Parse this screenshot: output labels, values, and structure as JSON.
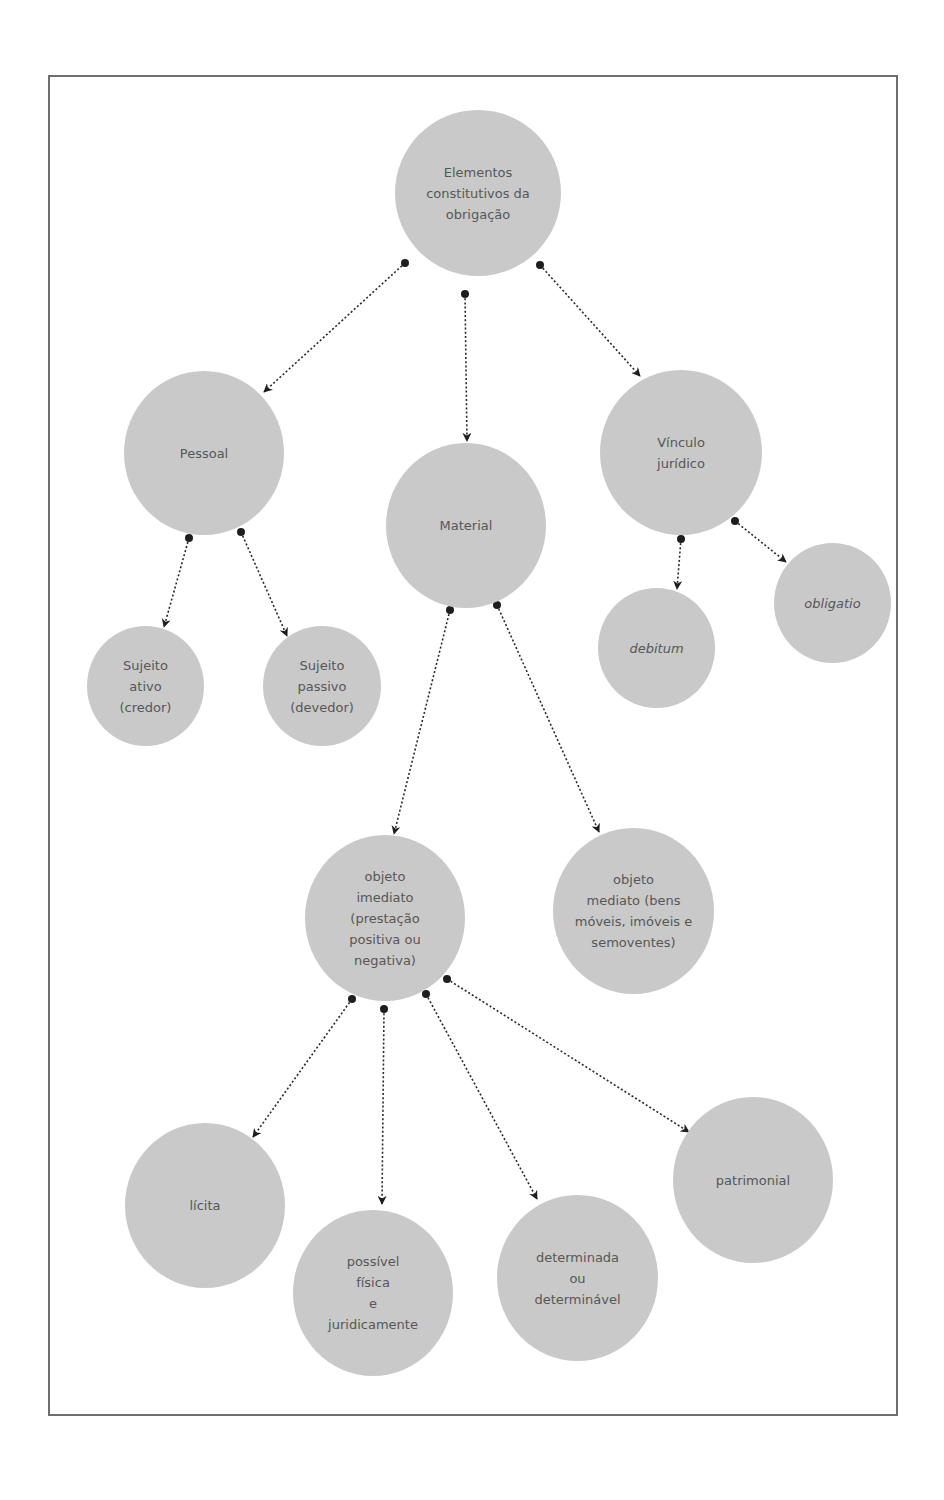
{
  "diagram": {
    "title": "Elementos constitutivos da obrigação",
    "colors": {
      "node_fill": "#c9c9c9",
      "node_text": "#575757",
      "edge": "#2a2a2a",
      "frame": "#6e6e6e"
    },
    "nodes": {
      "root": {
        "label": "Elementos\nconstitutivos da\nobrigação"
      },
      "pessoal": {
        "label": "Pessoal"
      },
      "material": {
        "label": "Material"
      },
      "vinculo": {
        "label": "Vínculo\njurídico"
      },
      "sujeito_ativo": {
        "label": "Sujeito\nativo\n(credor)"
      },
      "sujeito_passivo": {
        "label": "Sujeito\npassivo\n(devedor)"
      },
      "debitum": {
        "label": "debitum"
      },
      "obligatio": {
        "label": "obligatio"
      },
      "objeto_imediato": {
        "label": "objeto\nimediato\n(prestação\npositiva ou\nnegativa)"
      },
      "objeto_mediato": {
        "label": "objeto\nmediato (bens\nmóveis, imóveis e\nsemoventes)"
      },
      "licita": {
        "label": "lícita"
      },
      "possivel": {
        "label": "possível\nfísica\ne\njuridicamente"
      },
      "determinada": {
        "label": "determinada\nou\ndeterminável"
      },
      "patrimonial": {
        "label": "patrimonial"
      }
    },
    "edges": [
      {
        "from": "root",
        "to": "pessoal"
      },
      {
        "from": "root",
        "to": "material"
      },
      {
        "from": "root",
        "to": "vinculo"
      },
      {
        "from": "pessoal",
        "to": "sujeito_ativo"
      },
      {
        "from": "pessoal",
        "to": "sujeito_passivo"
      },
      {
        "from": "vinculo",
        "to": "debitum"
      },
      {
        "from": "vinculo",
        "to": "obligatio"
      },
      {
        "from": "material",
        "to": "objeto_imediato"
      },
      {
        "from": "material",
        "to": "objeto_mediato"
      },
      {
        "from": "objeto_imediato",
        "to": "licita"
      },
      {
        "from": "objeto_imediato",
        "to": "possivel"
      },
      {
        "from": "objeto_imediato",
        "to": "determinada"
      },
      {
        "from": "objeto_imediato",
        "to": "patrimonial"
      }
    ]
  }
}
